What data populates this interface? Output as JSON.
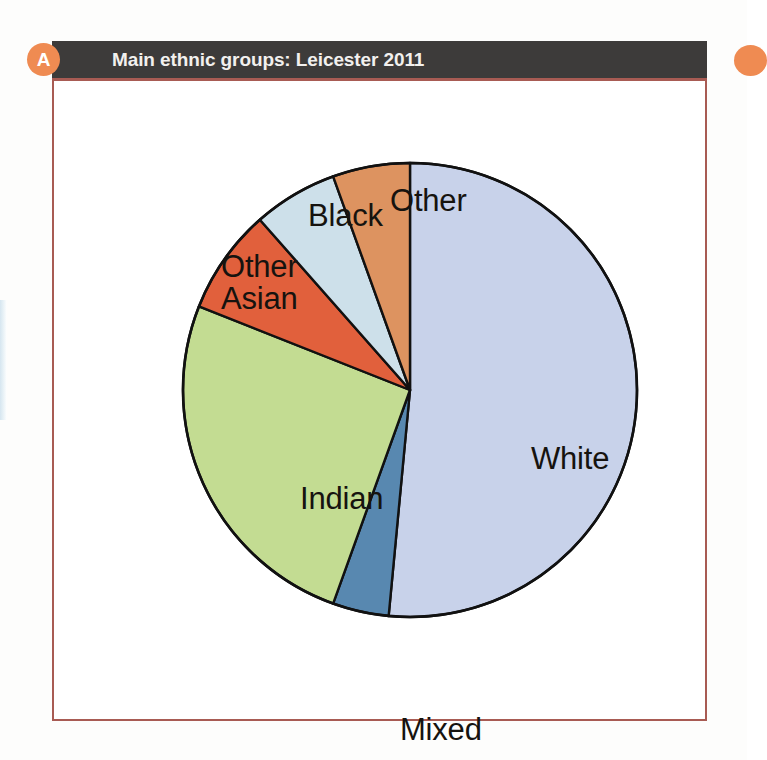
{
  "page": {
    "background_color": "#fdfdfc"
  },
  "panel": {
    "badge": "A",
    "badge_color": "#ef8b52",
    "header_title": "Main ethnic groups: Leicester 2011",
    "header_background": "#3d3b3a",
    "border_color": "#a85b53"
  },
  "next_panel": {
    "badge": "",
    "badge_color": "#ef8b52"
  },
  "labels": {
    "white": "White",
    "indian": "Indian",
    "mixed": "Mixed",
    "black": "Black",
    "other": "Other",
    "other_asian_line1": "Other",
    "other_asian_line2": "Asian"
  },
  "chart_data": {
    "type": "pie",
    "title": "Main ethnic groups: Leicester 2011",
    "xlabel": "",
    "ylabel": "",
    "legend_position": "none",
    "labels_inside_or_outside": "mixed",
    "start_angle_deg": 0,
    "direction": "clockwise",
    "categories": [
      "White",
      "Mixed",
      "Indian",
      "Other Asian",
      "Black",
      "Other"
    ],
    "values": [
      51.5,
      4.0,
      25.5,
      7.5,
      6.0,
      5.5
    ],
    "units": "percent",
    "colors": [
      "#c8d2ea",
      "#5888b0",
      "#c3dc92",
      "#e1603c",
      "#cde0ea",
      "#dd9360"
    ],
    "slice_outline_color": "#111111",
    "slices": [
      {
        "label": "White",
        "value": 51.5,
        "color": "#c8d2ea",
        "start_deg": 0,
        "end_deg": 185.4,
        "label_placement": "inside"
      },
      {
        "label": "Mixed",
        "value": 4.0,
        "color": "#5888b0",
        "start_deg": 185.4,
        "end_deg": 199.8,
        "label_placement": "outside-bottom"
      },
      {
        "label": "Indian",
        "value": 25.5,
        "color": "#c3dc92",
        "start_deg": 199.8,
        "end_deg": 291.6,
        "label_placement": "inside"
      },
      {
        "label": "Other Asian",
        "value": 7.5,
        "color": "#e1603c",
        "start_deg": 291.6,
        "end_deg": 318.6,
        "label_placement": "outside-left"
      },
      {
        "label": "Black",
        "value": 6.0,
        "color": "#cde0ea",
        "start_deg": 318.6,
        "end_deg": 340.2,
        "label_placement": "outside-top"
      },
      {
        "label": "Other",
        "value": 5.5,
        "color": "#dd9360",
        "start_deg": 340.2,
        "end_deg": 360.0,
        "label_placement": "outside-top"
      }
    ]
  }
}
